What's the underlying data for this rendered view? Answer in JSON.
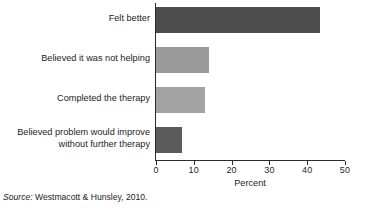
{
  "chart_data": {
    "type": "bar",
    "orientation": "horizontal",
    "title": "",
    "xlabel": "Percent",
    "ylabel": "",
    "xlim": [
      0,
      50
    ],
    "xticks": [
      0,
      10,
      20,
      30,
      40,
      50
    ],
    "xtick_labels": [
      "0",
      "10",
      "20",
      "30",
      "40",
      "50"
    ],
    "grid": false,
    "legend": null,
    "categories": [
      "Felt better",
      "Believed it was not helping",
      "Completed the therapy",
      "Believed problem would improve\nwithout further therapy"
    ],
    "values": [
      43.5,
      14,
      13,
      7
    ],
    "bar_colors": [
      "#4d4d4d",
      "#9b9b9b",
      "#a3a3a3",
      "#5c5c5c"
    ]
  },
  "bars": [
    {
      "label": "Felt better",
      "value": 43.5,
      "color": "#4d4d4d"
    },
    {
      "label": "Believed it was not helping",
      "value": 14,
      "color": "#9b9b9b"
    },
    {
      "label": "Completed the therapy",
      "value": 13,
      "color": "#a3a3a3"
    },
    {
      "label": "Believed problem would improve\nwithout further therapy",
      "value": 7,
      "color": "#5c5c5c"
    }
  ],
  "axis": {
    "x_title": "Percent",
    "ticks": [
      "0",
      "10",
      "20",
      "30",
      "40",
      "50"
    ]
  },
  "source": {
    "prefix": "Source:",
    "text": "Westmacott & Hunsley, 2010."
  }
}
